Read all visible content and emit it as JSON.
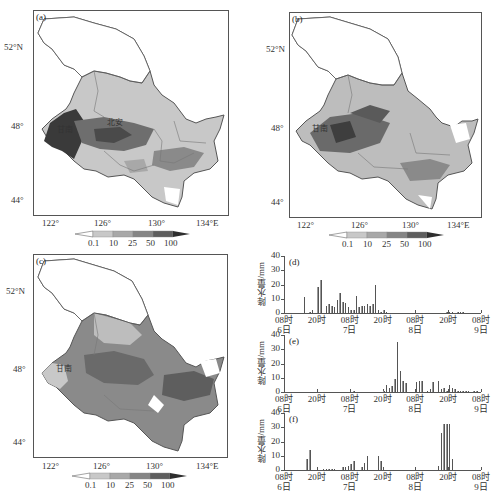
{
  "colorbar": {
    "levels": [
      "0.1",
      "10",
      "25",
      "50",
      "100"
    ],
    "colors": [
      "#ffffff",
      "#c8c8c8",
      "#a8a8a8",
      "#858585",
      "#5e5e5e",
      "#2e2e2e"
    ]
  },
  "maps": [
    {
      "label": "(a)",
      "annotations": [
        "甘南",
        "北安"
      ],
      "lat_ticks": [
        "52°N",
        "48°",
        "44°"
      ],
      "lon_ticks": [
        "122°",
        "126°",
        "130°",
        "134°E"
      ]
    },
    {
      "label": "(b)",
      "annotations": [
        "甘南"
      ],
      "lat_ticks": [
        "52°N",
        "48°",
        "44°"
      ],
      "lon_ticks": [
        "122°",
        "126°",
        "130°",
        "134°E"
      ]
    },
    {
      "label": "(c)",
      "annotations": [
        "甘南"
      ],
      "lat_ticks": [
        "52°N",
        "48°",
        "44°"
      ],
      "lon_ticks": [
        "122°",
        "126°",
        "130°",
        "134°E"
      ]
    }
  ],
  "chart_data": [
    {
      "type": "bar",
      "title": "(d)",
      "ylabel": "降水量/mm",
      "xlabel": "",
      "ylim": [
        0,
        40
      ],
      "yticks": [
        "0",
        "10",
        "20",
        "30",
        "40"
      ],
      "xticks": [
        {
          "line1": "08时",
          "line2": "6日"
        },
        {
          "line1": "20时",
          "line2": ""
        },
        {
          "line1": "08时",
          "line2": "7日"
        },
        {
          "line1": "20时",
          "line2": ""
        },
        {
          "line1": "08时",
          "line2": "8日"
        },
        {
          "line1": "20时",
          "line2": ""
        },
        {
          "line1": "08时",
          "line2": "9日"
        }
      ],
      "x_hours": "hourly from 08时 6日 to 08时 9日 (72 h)",
      "values": [
        0,
        0,
        0,
        0,
        0,
        0,
        0,
        11,
        0,
        1,
        2,
        0,
        18,
        23,
        0,
        5,
        6,
        5,
        4,
        9,
        14,
        8,
        7,
        4,
        2,
        2,
        12,
        4,
        5,
        5,
        6,
        5,
        6,
        20,
        2,
        1,
        2,
        1,
        0,
        0,
        0,
        0,
        0,
        0,
        0,
        0,
        0,
        0,
        0,
        0,
        0,
        0,
        0,
        0,
        0,
        0,
        0,
        0,
        0,
        0.5,
        0.5,
        0.5,
        0,
        0.5,
        1,
        0.5,
        0,
        0,
        0,
        0,
        0,
        0
      ]
    },
    {
      "type": "bar",
      "title": "(e)",
      "ylabel": "降水量/mm",
      "xlabel": "",
      "ylim": [
        0,
        40
      ],
      "yticks": [
        "0",
        "10",
        "20",
        "30",
        "40"
      ],
      "xticks": [
        {
          "line1": "08时",
          "line2": "6日"
        },
        {
          "line1": "20时",
          "line2": ""
        },
        {
          "line1": "08时",
          "line2": "7日"
        },
        {
          "line1": "20时",
          "line2": ""
        },
        {
          "line1": "08时",
          "line2": "8日"
        },
        {
          "line1": "20时",
          "line2": ""
        },
        {
          "line1": "08时",
          "line2": "9日"
        }
      ],
      "x_hours": "hourly from 08时 6日 to 08时 9日 (72 h)",
      "values": [
        0,
        0,
        0,
        0,
        0,
        0,
        0,
        0,
        0,
        0,
        0,
        0,
        0,
        0,
        0,
        0,
        0,
        0,
        0,
        0,
        0,
        0,
        0,
        0,
        0,
        0.5,
        0,
        0,
        0,
        0,
        0,
        0,
        0,
        0,
        0,
        0,
        1,
        5,
        3,
        4,
        9,
        35,
        15,
        8,
        6,
        0,
        0,
        0,
        7,
        8,
        8,
        0,
        1,
        2,
        7,
        0,
        8,
        2,
        3,
        1,
        5,
        3,
        2,
        1,
        1,
        1,
        0.5,
        0.5,
        0,
        1,
        0.5,
        0
      ]
    },
    {
      "type": "bar",
      "title": "(f)",
      "ylabel": "降水量/mm",
      "xlabel": "",
      "ylim": [
        0,
        40
      ],
      "yticks": [
        "0",
        "10",
        "20",
        "30",
        "40"
      ],
      "xticks": [
        {
          "line1": "08时",
          "line2": "6日"
        },
        {
          "line1": "20时",
          "line2": ""
        },
        {
          "line1": "08时",
          "line2": "7日"
        },
        {
          "line1": "20时",
          "line2": ""
        },
        {
          "line1": "08时",
          "line2": "8日"
        },
        {
          "line1": "20时",
          "line2": ""
        },
        {
          "line1": "08时",
          "line2": "9日"
        }
      ],
      "x_hours": "hourly from 08时 6日 to 08时 9日 (72 h)",
      "values": [
        0,
        0,
        0,
        0,
        0,
        0,
        0,
        0,
        8,
        14,
        0,
        0,
        0,
        0,
        1,
        1,
        1,
        1,
        1,
        0,
        0,
        2,
        2,
        3,
        4,
        6,
        0,
        0,
        2,
        5,
        10,
        0,
        0,
        0,
        10,
        6,
        0,
        0,
        0,
        0,
        0,
        0,
        0,
        0,
        0,
        0,
        0,
        0,
        0,
        0,
        0,
        0,
        0,
        0,
        0,
        0,
        3,
        26,
        32,
        32,
        32,
        8,
        0,
        0,
        0,
        0,
        0,
        0,
        0,
        0,
        0,
        0
      ]
    }
  ]
}
